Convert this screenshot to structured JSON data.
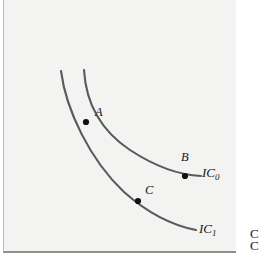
{
  "figure": {
    "type": "indifference-curve-diagram",
    "background_color": "#f3f3f1",
    "curve_color": "#59595e",
    "point_color": "#111114",
    "panel": {
      "x": 3,
      "y": 0,
      "width": 233,
      "height": 253
    }
  },
  "curves": [
    {
      "id": "IC0",
      "label": "IC",
      "subscript": "0",
      "label_x": 202,
      "label_y": 172,
      "description": "flatter indifference curve passing through A and B",
      "path": "M 84 70 C 86 104, 100 130, 130 150 C 156 167, 180 175, 201 176"
    },
    {
      "id": "IC1",
      "label": "IC",
      "subscript": "1",
      "label_x": 199,
      "label_y": 228,
      "description": "lower indifference curve passing through A and C",
      "path": "M 61 71 C 66 110, 90 160, 124 192 C 150 215, 175 226, 196 230"
    }
  ],
  "points": [
    {
      "id": "A",
      "label": "A",
      "x": 86,
      "y": 122,
      "label_x": 95,
      "label_y": 112,
      "note": "intersection of the two curves"
    },
    {
      "id": "B",
      "label": "B",
      "x": 185,
      "y": 176,
      "label_x": 181,
      "label_y": 157,
      "note": "on IC0"
    },
    {
      "id": "C",
      "label": "C",
      "x": 138,
      "y": 201,
      "label_x": 145,
      "label_y": 190,
      "note": "on IC1"
    }
  ],
  "margin_text": {
    "line1": "C",
    "line2": "C"
  }
}
